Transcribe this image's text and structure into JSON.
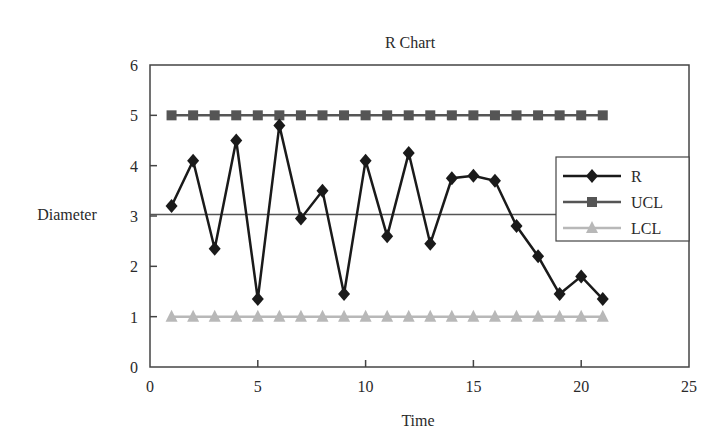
{
  "chart_data": {
    "type": "line",
    "title": "R Chart",
    "xlabel": "Time",
    "ylabel": "Diameter",
    "xlim": [
      0,
      25
    ],
    "ylim": [
      0,
      6
    ],
    "x_ticks": [
      0,
      5,
      10,
      15,
      20,
      25
    ],
    "y_ticks": [
      0,
      1,
      2,
      3,
      4,
      5,
      6
    ],
    "grid": false,
    "center_line": 3.03,
    "legend_position": "right-inside",
    "x": [
      1,
      2,
      3,
      4,
      5,
      6,
      7,
      8,
      9,
      10,
      11,
      12,
      13,
      14,
      15,
      16,
      17,
      18,
      19,
      20,
      21
    ],
    "series": [
      {
        "name": "R",
        "marker": "diamond",
        "color": "#1a1a1a",
        "values": [
          3.2,
          4.1,
          2.35,
          4.5,
          1.35,
          4.8,
          2.95,
          3.5,
          1.45,
          4.1,
          2.6,
          4.25,
          2.45,
          3.75,
          3.8,
          3.7,
          2.8,
          2.2,
          1.45,
          1.8,
          1.35
        ]
      },
      {
        "name": "UCL",
        "marker": "square",
        "color": "#555555",
        "values": [
          5,
          5,
          5,
          5,
          5,
          5,
          5,
          5,
          5,
          5,
          5,
          5,
          5,
          5,
          5,
          5,
          5,
          5,
          5,
          5,
          5
        ]
      },
      {
        "name": "LCL",
        "marker": "triangle",
        "color": "#b8b8b8",
        "values": [
          1,
          1,
          1,
          1,
          1,
          1,
          1,
          1,
          1,
          1,
          1,
          1,
          1,
          1,
          1,
          1,
          1,
          1,
          1,
          1,
          1
        ]
      }
    ]
  }
}
